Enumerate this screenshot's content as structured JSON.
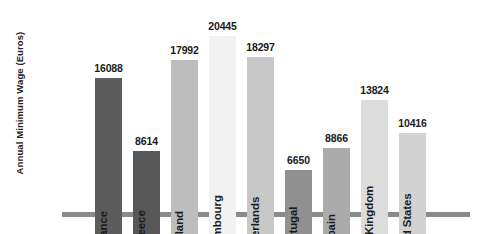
{
  "chart_data": {
    "type": "bar",
    "title": "",
    "xlabel": "",
    "ylabel": "Annual Minimum Wage (Euros)",
    "ylim": [
      0,
      22000
    ],
    "grid": false,
    "legend": "none",
    "orientation": "vertical",
    "value_labels_shown": true,
    "categories": [
      "France",
      "Greece",
      "Ireland",
      "Luxembourg",
      "Netherlands",
      "Portugal",
      "Spain",
      "United Kingdom",
      "United States"
    ],
    "values": [
      16088,
      8614,
      17992,
      20445,
      18297,
      6650,
      8866,
      13824,
      10416
    ],
    "value_labels": [
      "16088",
      "8614",
      "17992",
      "20445",
      "18297",
      "6650",
      "8866",
      "13824",
      "10416"
    ],
    "bar_colors": [
      "#5c5c5c",
      "#575757",
      "#bdbdbd",
      "#f2f2f2",
      "#c8c8c8",
      "#909090",
      "#ababab",
      "#dcdcdc",
      "#d2d2d2"
    ],
    "axis_color": "#8a8a8a",
    "background_color": "#ffffff",
    "text_color": "#1a1a1a"
  }
}
